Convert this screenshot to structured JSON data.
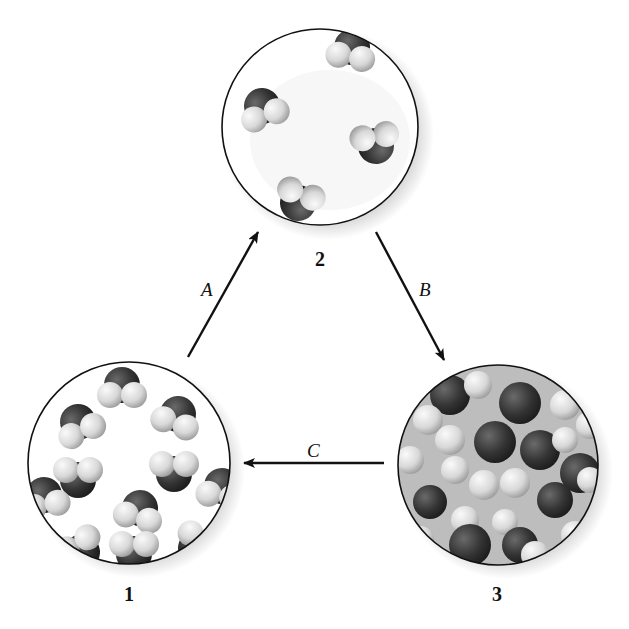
{
  "diagram": {
    "type": "phase-change cycle (molecular views)",
    "states": [
      {
        "id": "1",
        "label": "1",
        "description": "ordered, closely packed molecules (solid)"
      },
      {
        "id": "2",
        "label": "2",
        "description": "widely separated molecules (gas)"
      },
      {
        "id": "3",
        "label": "3",
        "description": "disordered, closely packed molecules (liquid)"
      }
    ],
    "transitions": [
      {
        "label": "A",
        "from": "1",
        "to": "2"
      },
      {
        "label": "B",
        "from": "2",
        "to": "3"
      },
      {
        "label": "C",
        "from": "3",
        "to": "1"
      }
    ],
    "colors": {
      "outline": "#111111",
      "dark_atom": "#3a3a3a",
      "light_atom": "#e6e6e6",
      "background": "#ffffff"
    }
  }
}
